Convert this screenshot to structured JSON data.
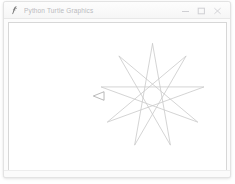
{
  "window": {
    "title": "Python Turtle Graphics",
    "icon": "python-feather-icon",
    "controls": [
      {
        "name": "minimize",
        "label": "–",
        "glyph": "minimize-icon"
      },
      {
        "name": "maximize",
        "label": "□",
        "glyph": "maximize-icon"
      },
      {
        "name": "close",
        "label": "×",
        "glyph": "close-icon"
      }
    ],
    "colors": {
      "titlebar_bg": "#f7f7f7",
      "titlebar_text": "#b9b9bd",
      "window_border": "#e3e3e3",
      "canvas_bg": "#ffffff",
      "canvas_border": "#d7d7d7"
    }
  },
  "canvas": {
    "name": "turtle-drawing-canvas",
    "background": "#ffffff",
    "width": 219,
    "height": 149,
    "drawing": {
      "shape": "star-polygon",
      "description": "9-pointed star polygon drawn by turtle",
      "points": 9,
      "step": 4,
      "center_x": 145,
      "center_y": 74,
      "radius": 53,
      "pen_color": "#c9c9c9",
      "pen_width": 0.8
    },
    "turtle": {
      "name": "turtle-cursor",
      "shape": "arrow",
      "x": 92,
      "y": 74,
      "heading": 180,
      "color": "#9a9a9a",
      "size": 7
    }
  }
}
